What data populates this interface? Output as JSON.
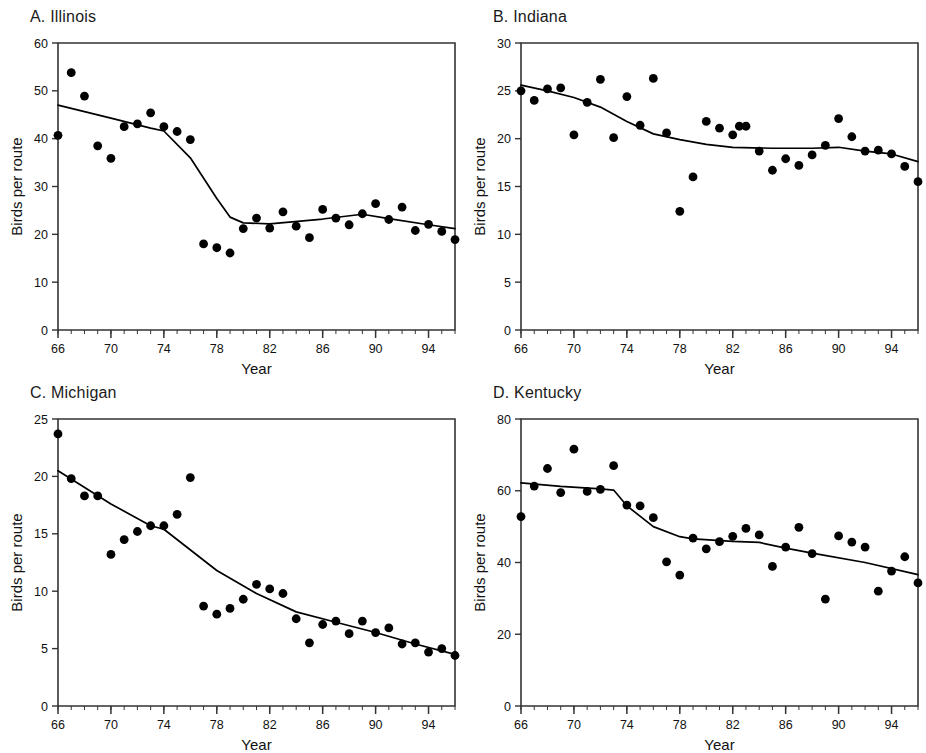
{
  "figure": {
    "shared_xlabel": "Year",
    "shared_ylabel": "Birds per route",
    "marker_color": "#000000",
    "line_color": "#000000",
    "axis_color": "#333333",
    "background": "#ffffff"
  },
  "panels": [
    {
      "id": "panel-a",
      "title": "A. Illinois",
      "letter": "A",
      "state": "Illinois",
      "chart_index": 0
    },
    {
      "id": "panel-b",
      "title": "B. Indiana",
      "letter": "B",
      "state": "Indiana",
      "chart_index": 1
    },
    {
      "id": "panel-c",
      "title": "C. Michigan",
      "letter": "C",
      "state": "Michigan",
      "chart_index": 2
    },
    {
      "id": "panel-d",
      "title": "D. Kentucky",
      "letter": "D",
      "state": "Kentucky",
      "chart_index": 3
    }
  ],
  "chart_data": [
    {
      "type": "scatter",
      "title": "A. Illinois",
      "xlabel": "Year",
      "ylabel": "Birds per route",
      "xlim": [
        66,
        96
      ],
      "ylim": [
        0,
        60
      ],
      "yticks": [
        0,
        10,
        20,
        30,
        40,
        50,
        60
      ],
      "xticks": [
        66,
        70,
        74,
        78,
        82,
        86,
        90,
        94
      ],
      "xtick_labels": [
        "66",
        "70",
        "74",
        "78",
        "82",
        "86",
        "90",
        "94"
      ],
      "ytick_labels": [
        "0",
        "10",
        "20",
        "30",
        "40",
        "50",
        "60"
      ],
      "minor_xtick_interval": 1,
      "grid": false,
      "legend": false,
      "x": [
        66,
        67,
        68,
        69,
        70,
        71,
        72,
        73,
        74,
        75,
        76,
        77,
        78,
        79,
        80,
        81,
        82,
        83,
        84,
        85,
        86,
        87,
        88,
        89,
        90,
        91,
        92,
        93,
        94,
        95,
        96
      ],
      "values": [
        40.7,
        53.8,
        48.9,
        38.5,
        35.9,
        42.5,
        43.1,
        45.4,
        42.5,
        41.5,
        39.8,
        18.0,
        17.2,
        16.1,
        21.2,
        23.4,
        21.3,
        24.7,
        21.7,
        19.3,
        25.2,
        23.4,
        22.0,
        24.3,
        26.4,
        23.1,
        25.7,
        20.8,
        22.1,
        20.6,
        18.9
      ],
      "trend": {
        "name": "smoothed trend",
        "x": [
          66,
          70,
          73,
          74,
          76,
          78,
          79,
          80,
          82,
          86,
          89,
          91,
          94,
          96
        ],
        "y": [
          47.0,
          44.3,
          42.2,
          41.6,
          36.0,
          27.5,
          23.6,
          22.4,
          22.2,
          23.2,
          24.2,
          23.3,
          22.0,
          21.2
        ]
      }
    },
    {
      "type": "scatter",
      "title": "B. Indiana",
      "xlabel": "Year",
      "ylabel": "Birds per route",
      "xlim": [
        66,
        96
      ],
      "ylim": [
        0,
        30
      ],
      "yticks": [
        0,
        5,
        10,
        15,
        20,
        25,
        30
      ],
      "xticks": [
        66,
        70,
        74,
        78,
        82,
        86,
        90,
        94
      ],
      "xtick_labels": [
        "66",
        "70",
        "74",
        "78",
        "82",
        "86",
        "90",
        "94"
      ],
      "ytick_labels": [
        "0",
        "5",
        "10",
        "15",
        "20",
        "25",
        "30"
      ],
      "minor_xtick_interval": 1,
      "grid": false,
      "legend": false,
      "x": [
        66,
        67,
        68,
        69,
        70,
        71,
        72,
        73,
        74,
        75,
        76,
        77,
        78,
        79,
        80,
        81,
        82,
        82.5,
        83,
        84,
        85,
        86,
        87,
        88,
        89,
        90,
        91,
        92,
        93,
        94,
        95,
        96
      ],
      "values": [
        25.0,
        24.0,
        25.2,
        25.3,
        20.4,
        23.8,
        26.2,
        20.1,
        24.4,
        21.4,
        26.3,
        20.6,
        12.4,
        16.0,
        21.8,
        21.1,
        20.4,
        21.3,
        21.3,
        18.7,
        16.7,
        17.9,
        17.2,
        18.3,
        19.3,
        22.1,
        20.2,
        18.7,
        18.8,
        18.4,
        17.1,
        15.5
      ],
      "trend": {
        "name": "smoothed trend",
        "x": [
          66,
          68,
          70,
          72,
          74,
          76,
          78,
          80,
          82,
          85,
          88,
          90,
          92,
          94,
          96
        ],
        "y": [
          25.6,
          25.0,
          24.3,
          23.3,
          21.8,
          20.5,
          19.9,
          19.4,
          19.1,
          19.0,
          19.0,
          19.1,
          18.7,
          18.4,
          17.6
        ]
      }
    },
    {
      "type": "scatter",
      "title": "C. Michigan",
      "xlabel": "Year",
      "ylabel": "Birds per route",
      "xlim": [
        66,
        96
      ],
      "ylim": [
        0,
        25
      ],
      "yticks": [
        0,
        5,
        10,
        15,
        20,
        25
      ],
      "xticks": [
        66,
        70,
        74,
        78,
        82,
        86,
        90,
        94
      ],
      "xtick_labels": [
        "66",
        "70",
        "74",
        "78",
        "82",
        "86",
        "90",
        "94"
      ],
      "ytick_labels": [
        "0",
        "5",
        "10",
        "15",
        "20",
        "25"
      ],
      "minor_xtick_interval": 1,
      "grid": false,
      "legend": false,
      "x": [
        66,
        67,
        68,
        69,
        70,
        71,
        72,
        73,
        74,
        75,
        76,
        77,
        78,
        79,
        80,
        81,
        82,
        83,
        84,
        85,
        86,
        87,
        88,
        89,
        90,
        91,
        92,
        93,
        94,
        95,
        96
      ],
      "values": [
        23.7,
        19.8,
        18.3,
        18.3,
        13.2,
        14.5,
        15.2,
        15.7,
        15.7,
        16.7,
        19.9,
        8.7,
        8.0,
        8.5,
        9.3,
        10.6,
        10.2,
        9.8,
        7.6,
        5.5,
        7.1,
        7.4,
        6.3,
        7.4,
        6.4,
        6.8,
        5.4,
        5.5,
        4.7,
        5.0,
        4.4
      ],
      "trend": {
        "name": "smoothed trend",
        "x": [
          66,
          70,
          73,
          74,
          78,
          81,
          84,
          87,
          90,
          93,
          96
        ],
        "y": [
          20.5,
          17.6,
          15.7,
          15.4,
          11.8,
          9.8,
          8.2,
          7.3,
          6.4,
          5.4,
          4.5
        ]
      }
    },
    {
      "type": "scatter",
      "title": "D. Kentucky",
      "xlabel": "Year",
      "ylabel": "Birds per route",
      "xlim": [
        66,
        96
      ],
      "ylim": [
        0,
        80
      ],
      "yticks": [
        0,
        20,
        40,
        60,
        80
      ],
      "xticks": [
        66,
        70,
        74,
        78,
        82,
        86,
        90,
        94
      ],
      "xtick_labels": [
        "66",
        "70",
        "74",
        "78",
        "82",
        "86",
        "90",
        "94"
      ],
      "ytick_labels": [
        "0",
        "20",
        "40",
        "60",
        "80"
      ],
      "minor_xtick_interval": 1,
      "grid": false,
      "legend": false,
      "x": [
        66,
        67,
        68,
        69,
        70,
        71,
        72,
        73,
        74,
        75,
        76,
        77,
        78,
        79,
        80,
        81,
        82,
        83,
        84,
        85,
        86,
        87,
        88,
        89,
        90,
        91,
        92,
        93,
        94,
        95,
        96
      ],
      "values": [
        52.8,
        61.3,
        66.2,
        59.5,
        71.6,
        59.8,
        60.4,
        67.0,
        56.0,
        55.8,
        52.5,
        40.2,
        36.5,
        46.8,
        43.8,
        45.8,
        47.3,
        49.5,
        47.7,
        38.9,
        44.3,
        49.8,
        42.5,
        29.8,
        47.4,
        45.7,
        44.3,
        32.0,
        37.6,
        41.6,
        34.3
      ],
      "trend": {
        "name": "smoothed trend",
        "x": [
          66,
          69,
          72,
          73,
          74,
          76,
          78,
          79,
          82,
          84,
          86,
          88,
          92,
          96
        ],
        "y": [
          62.2,
          61.2,
          60.5,
          60.2,
          55.8,
          50.0,
          47.2,
          46.6,
          45.9,
          45.6,
          44.0,
          42.6,
          40.0,
          36.6
        ]
      }
    }
  ]
}
